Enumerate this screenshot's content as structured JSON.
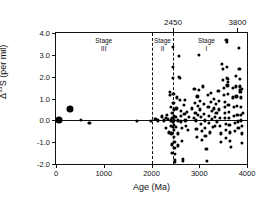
{
  "chart_data": {
    "type": "scatter",
    "title": "",
    "xlabel": "Age (Ma)",
    "ylabel_prefix": "Δ",
    "ylabel_sup": "33",
    "ylabel_suffix": "S (per mil)",
    "ylabel_full": "Δ33S (per mil)",
    "xlim": [
      0,
      4000
    ],
    "ylim": [
      -2.0,
      4.0
    ],
    "grid": false,
    "legend": "none",
    "xticks": [
      0,
      1000,
      2000,
      3000,
      4000
    ],
    "xtick_labels": [
      "0",
      "1000",
      "2000",
      "3000",
      "4000"
    ],
    "yticks": [
      -2.0,
      -1.0,
      0.0,
      1.0,
      2.0,
      3.0,
      4.0
    ],
    "ytick_labels": [
      "-2.0",
      "-1.0",
      "0.0",
      "1.0",
      "2.0",
      "3.0",
      "4.0"
    ],
    "zero_line": 0.0,
    "top_annotations": [
      {
        "value": 2450,
        "label": "2450"
      },
      {
        "value": 3800,
        "label": "3800"
      }
    ],
    "dividers": [
      2000,
      2450
    ],
    "stage_annotations": [
      {
        "label": "Stage",
        "numeral": "III",
        "x": 1000
      },
      {
        "label": "Stage",
        "numeral": "II",
        "x": 2230
      },
      {
        "label": "Stage",
        "numeral": "I",
        "x": 3150
      }
    ],
    "marker_color": "#000000",
    "series": [
      {
        "name": "large-markers",
        "marker_size": 7,
        "points": [
          [
            60,
            0.0
          ],
          [
            290,
            0.52
          ]
        ]
      },
      {
        "name": "small-markers",
        "marker_size": 3.2,
        "points": [
          [
            520,
            0.02
          ],
          [
            700,
            -0.12
          ],
          [
            1690,
            -0.04
          ],
          [
            1980,
            -0.02
          ],
          [
            2080,
            0.05
          ],
          [
            2140,
            0.0
          ],
          [
            2210,
            0.18
          ],
          [
            2260,
            0.0
          ],
          [
            2300,
            0.1
          ],
          [
            2310,
            -0.35
          ],
          [
            2330,
            0.25
          ],
          [
            2350,
            0.05
          ],
          [
            2360,
            -0.55
          ],
          [
            2380,
            1.15
          ],
          [
            2390,
            1.3
          ],
          [
            2400,
            0.6
          ],
          [
            2405,
            0.0
          ],
          [
            2410,
            -0.25
          ],
          [
            2415,
            -0.6
          ],
          [
            2420,
            -1.1
          ],
          [
            2425,
            -1.5
          ],
          [
            2430,
            0.35
          ],
          [
            2435,
            0.1
          ],
          [
            2440,
            -0.05
          ],
          [
            2445,
            -0.3
          ],
          [
            2450,
            3.35
          ],
          [
            2452,
            2.45
          ],
          [
            2455,
            1.95
          ],
          [
            2458,
            1.2
          ],
          [
            2460,
            0.8
          ],
          [
            2462,
            0.5
          ],
          [
            2465,
            0.2
          ],
          [
            2468,
            0.0
          ],
          [
            2470,
            -0.2
          ],
          [
            2472,
            -0.45
          ],
          [
            2475,
            -0.75
          ],
          [
            2478,
            -1.0
          ],
          [
            2480,
            -1.25
          ],
          [
            2482,
            -1.55
          ],
          [
            2485,
            -1.8
          ],
          [
            2490,
            -1.9
          ],
          [
            2500,
            0.15
          ],
          [
            2510,
            -0.3
          ],
          [
            2520,
            0.55
          ],
          [
            2530,
            1.05
          ],
          [
            2545,
            0.0
          ],
          [
            2550,
            -0.6
          ],
          [
            2560,
            -1.15
          ],
          [
            2570,
            2.95
          ],
          [
            2580,
            2.0
          ],
          [
            2590,
            1.95
          ],
          [
            2600,
            0.95
          ],
          [
            2610,
            0.45
          ],
          [
            2615,
            0.2
          ],
          [
            2620,
            -0.05
          ],
          [
            2630,
            -0.35
          ],
          [
            2640,
            -0.95
          ],
          [
            2650,
            -1.75
          ],
          [
            2660,
            -1.85
          ],
          [
            2680,
            0.7
          ],
          [
            2690,
            0.3
          ],
          [
            2700,
            0.95
          ],
          [
            2710,
            0.0
          ],
          [
            2720,
            -0.25
          ],
          [
            2740,
            0.4
          ],
          [
            2760,
            -0.45
          ],
          [
            2790,
            0.15
          ],
          [
            2850,
            0.55
          ],
          [
            2880,
            0.1
          ],
          [
            2900,
            1.45
          ],
          [
            2910,
            0.8
          ],
          [
            2920,
            0.35
          ],
          [
            2930,
            0.0
          ],
          [
            2940,
            -0.4
          ],
          [
            2950,
            -0.75
          ],
          [
            2960,
            1.1
          ],
          [
            2970,
            0.65
          ],
          [
            2980,
            0.25
          ],
          [
            2990,
            2.98
          ],
          [
            3000,
            1.4
          ],
          [
            3010,
            0.9
          ],
          [
            3020,
            0.5
          ],
          [
            3030,
            0.15
          ],
          [
            3040,
            -0.15
          ],
          [
            3050,
            -0.5
          ],
          [
            3060,
            -0.9
          ],
          [
            3080,
            1.55
          ],
          [
            3090,
            0.75
          ],
          [
            3100,
            0.3
          ],
          [
            3110,
            0.0
          ],
          [
            3120,
            -0.35
          ],
          [
            3130,
            -0.7
          ],
          [
            3150,
            -1.3
          ],
          [
            3160,
            -1.85
          ],
          [
            3180,
            1.15
          ],
          [
            3190,
            0.6
          ],
          [
            3200,
            0.2
          ],
          [
            3210,
            -0.1
          ],
          [
            3220,
            -0.55
          ],
          [
            3240,
            1.25
          ],
          [
            3250,
            0.85
          ],
          [
            3260,
            0.45
          ],
          [
            3270,
            0.05
          ],
          [
            3280,
            -0.3
          ],
          [
            3300,
            1.0
          ],
          [
            3310,
            0.55
          ],
          [
            3320,
            0.15
          ],
          [
            3330,
            -0.25
          ],
          [
            3350,
            0.75
          ],
          [
            3360,
            0.35
          ],
          [
            3370,
            -0.05
          ],
          [
            3400,
            1.35
          ],
          [
            3410,
            0.9
          ],
          [
            3420,
            0.5
          ],
          [
            3430,
            0.1
          ],
          [
            3440,
            -0.25
          ],
          [
            3450,
            -0.6
          ],
          [
            3460,
            -1.0
          ],
          [
            3480,
            2.6
          ],
          [
            3490,
            2.35
          ],
          [
            3500,
            1.85
          ],
          [
            3510,
            1.5
          ],
          [
            3520,
            1.15
          ],
          [
            3530,
            0.85
          ],
          [
            3535,
            0.6
          ],
          [
            3540,
            0.35
          ],
          [
            3545,
            0.1
          ],
          [
            3550,
            -0.15
          ],
          [
            3555,
            -0.45
          ],
          [
            3560,
            -0.8
          ],
          [
            3570,
            3.7
          ],
          [
            3575,
            3.6
          ],
          [
            3580,
            2.45
          ],
          [
            3585,
            1.95
          ],
          [
            3590,
            1.6
          ],
          [
            3595,
            1.9
          ],
          [
            3600,
            1.75
          ],
          [
            3605,
            1.2
          ],
          [
            3610,
            0.7
          ],
          [
            3615,
            0.4
          ],
          [
            3620,
            0.1
          ],
          [
            3630,
            -0.2
          ],
          [
            3640,
            -0.55
          ],
          [
            3650,
            -0.95
          ],
          [
            3660,
            -1.2
          ],
          [
            3700,
            1.5
          ],
          [
            3710,
            1.05
          ],
          [
            3720,
            0.6
          ],
          [
            3730,
            0.2
          ],
          [
            3740,
            -0.1
          ],
          [
            3750,
            -0.5
          ],
          [
            3760,
            2.05
          ],
          [
            3770,
            1.55
          ],
          [
            3780,
            1.1
          ],
          [
            3790,
            0.65
          ],
          [
            3800,
            0.25
          ],
          [
            3810,
            -0.05
          ],
          [
            3820,
            -0.35
          ],
          [
            3830,
            3.3
          ],
          [
            3840,
            2.35
          ],
          [
            3845,
            1.9
          ],
          [
            3850,
            1.55
          ],
          [
            3855,
            1.4
          ],
          [
            3860,
            1.3
          ],
          [
            3865,
            1.05
          ],
          [
            3870,
            0.6
          ],
          [
            3875,
            0.25
          ],
          [
            3880,
            0.0
          ],
          [
            3885,
            -0.25
          ],
          [
            3890,
            -0.6
          ],
          [
            3895,
            -1.05
          ],
          [
            3900,
            1.45
          ],
          [
            3910,
            0.35
          ]
        ]
      }
    ]
  }
}
